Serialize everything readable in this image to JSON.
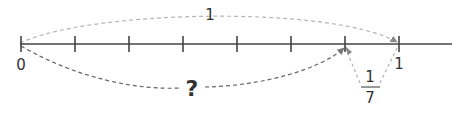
{
  "diagram": {
    "type": "number-line",
    "axis": {
      "start_label": "0",
      "end_label": "1",
      "divisions": 7,
      "line_color": "#444444"
    },
    "top_arc": {
      "label": "1",
      "from": "0",
      "to": "1",
      "color": "#b0b0b0"
    },
    "bottom_arc": {
      "label": "?",
      "from": "0",
      "to": "6/7",
      "color": "#555555"
    },
    "small_arc": {
      "numerator": "1",
      "denominator": "7",
      "from": "6/7",
      "to": "1",
      "color": "#999999"
    }
  }
}
